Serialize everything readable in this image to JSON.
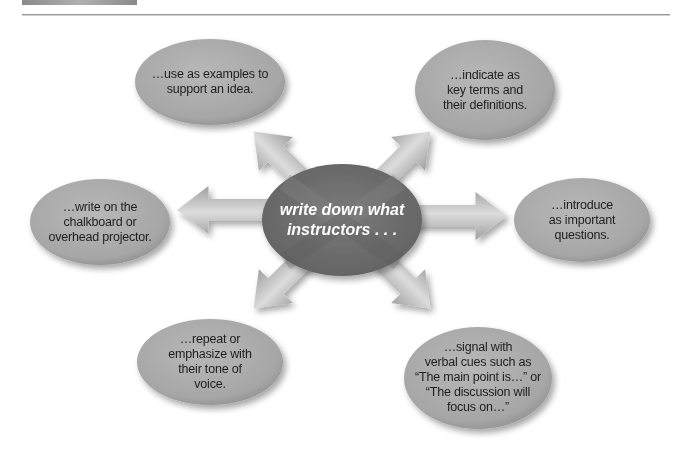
{
  "diagram": {
    "center": {
      "line1": "write down what",
      "line2": "instructors . . ."
    },
    "bubbles": [
      {
        "id": "top-left",
        "lines": [
          "…use as examples to",
          "support an idea."
        ]
      },
      {
        "id": "top-right",
        "lines": [
          "…indicate as",
          "key terms and",
          "their definitions."
        ]
      },
      {
        "id": "left",
        "lines": [
          "…write on the",
          "chalkboard or",
          "overhead projector."
        ]
      },
      {
        "id": "right",
        "lines": [
          "…introduce",
          "as important",
          "questions."
        ]
      },
      {
        "id": "bottom-left",
        "lines": [
          "…repeat or",
          "emphasize with",
          "their tone of",
          "voice."
        ]
      },
      {
        "id": "bottom-right",
        "lines": [
          "…signal with",
          "verbal cues such as",
          "“The main point is…” or",
          "“The discussion will",
          "focus on…”"
        ]
      }
    ],
    "colors": {
      "bubble_fill": "#a9a9a9",
      "center_fill": "#6f6f6f",
      "arrow_fill": "#bdbdbd",
      "rule": "#9a9a9a"
    }
  }
}
